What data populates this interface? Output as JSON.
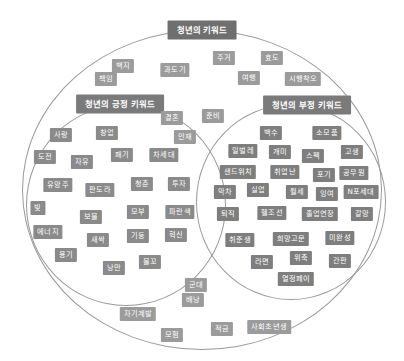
{
  "diagram": {
    "type": "venn-keyword-map",
    "title": "청년의 키워드",
    "groups": {
      "neutral": {
        "label": "청년의 키워드",
        "region": "outer-ellipse"
      },
      "positive": {
        "label": "청년의 긍정 키워드",
        "region": "left-circle"
      },
      "negative": {
        "label": "청년의 부정 키워드",
        "region": "right-circle"
      }
    },
    "colors": {
      "tag_fill": "#9b9b9b",
      "tag_text": "#ffffff",
      "heading_fill": "#7a7a7a",
      "outline": "#9a9a9a",
      "background": "#ffffff"
    },
    "neutral_keywords": [
      {
        "text": "백지",
        "x": 123,
        "y": 66
      },
      {
        "text": "주거",
        "x": 224,
        "y": 58
      },
      {
        "text": "효도",
        "x": 272,
        "y": 58
      },
      {
        "text": "책임",
        "x": 106,
        "y": 79
      },
      {
        "text": "과도기",
        "x": 175,
        "y": 70
      },
      {
        "text": "여행",
        "x": 249,
        "y": 78
      },
      {
        "text": "시행착오",
        "x": 303,
        "y": 79
      },
      {
        "text": "결혼",
        "x": 172,
        "y": 118
      },
      {
        "text": "준비",
        "x": 213,
        "y": 116
      },
      {
        "text": "인재",
        "x": 185,
        "y": 137
      },
      {
        "text": "군대",
        "x": 196,
        "y": 285
      },
      {
        "text": "배낭",
        "x": 193,
        "y": 300
      },
      {
        "text": "자기계발",
        "x": 138,
        "y": 314
      },
      {
        "text": "모험",
        "x": 172,
        "y": 335
      },
      {
        "text": "적금",
        "x": 222,
        "y": 329
      },
      {
        "text": "사회초년생",
        "x": 269,
        "y": 327
      }
    ],
    "positive_keywords": [
      {
        "text": "사랑",
        "x": 61,
        "y": 135
      },
      {
        "text": "창업",
        "x": 107,
        "y": 133
      },
      {
        "text": "도전",
        "x": 45,
        "y": 157
      },
      {
        "text": "자유",
        "x": 82,
        "y": 162
      },
      {
        "text": "패기",
        "x": 122,
        "y": 155
      },
      {
        "text": "차세대",
        "x": 164,
        "y": 155
      },
      {
        "text": "유망주",
        "x": 58,
        "y": 185
      },
      {
        "text": "판도라",
        "x": 100,
        "y": 190
      },
      {
        "text": "청춘",
        "x": 142,
        "y": 184
      },
      {
        "text": "투자",
        "x": 179,
        "y": 184
      },
      {
        "text": "빛",
        "x": 38,
        "y": 208
      },
      {
        "text": "보물",
        "x": 91,
        "y": 217
      },
      {
        "text": "모부",
        "x": 138,
        "y": 212
      },
      {
        "text": "파란색",
        "x": 180,
        "y": 212
      },
      {
        "text": "에너지",
        "x": 48,
        "y": 232
      },
      {
        "text": "새싹",
        "x": 98,
        "y": 240
      },
      {
        "text": "기둥",
        "x": 138,
        "y": 236
      },
      {
        "text": "혁신",
        "x": 176,
        "y": 235
      },
      {
        "text": "용기",
        "x": 66,
        "y": 255
      },
      {
        "text": "낭만",
        "x": 114,
        "y": 268
      },
      {
        "text": "물꼬",
        "x": 150,
        "y": 262
      }
    ],
    "negative_keywords": [
      {
        "text": "백수",
        "x": 271,
        "y": 133
      },
      {
        "text": "소모품",
        "x": 327,
        "y": 133
      },
      {
        "text": "일벌레",
        "x": 243,
        "y": 151
      },
      {
        "text": "개미",
        "x": 280,
        "y": 152
      },
      {
        "text": "스펙",
        "x": 313,
        "y": 156
      },
      {
        "text": "고생",
        "x": 352,
        "y": 152
      },
      {
        "text": "샌드위치",
        "x": 238,
        "y": 172
      },
      {
        "text": "취업난",
        "x": 285,
        "y": 172
      },
      {
        "text": "포기",
        "x": 324,
        "y": 175
      },
      {
        "text": "공무원",
        "x": 354,
        "y": 173
      },
      {
        "text": "막차",
        "x": 225,
        "y": 192
      },
      {
        "text": "실업",
        "x": 258,
        "y": 190
      },
      {
        "text": "월세",
        "x": 297,
        "y": 192
      },
      {
        "text": "잉여",
        "x": 327,
        "y": 194
      },
      {
        "text": "N포세대",
        "x": 361,
        "y": 192
      },
      {
        "text": "퇴직",
        "x": 228,
        "y": 214
      },
      {
        "text": "헬조선",
        "x": 272,
        "y": 213
      },
      {
        "text": "졸업연장",
        "x": 320,
        "y": 214
      },
      {
        "text": "갈망",
        "x": 362,
        "y": 214
      },
      {
        "text": "취준생",
        "x": 240,
        "y": 240
      },
      {
        "text": "희망고문",
        "x": 291,
        "y": 239
      },
      {
        "text": "미완성",
        "x": 340,
        "y": 238
      },
      {
        "text": "라면",
        "x": 262,
        "y": 262
      },
      {
        "text": "위축",
        "x": 301,
        "y": 258
      },
      {
        "text": "간판",
        "x": 340,
        "y": 261
      },
      {
        "text": "열정페이",
        "x": 296,
        "y": 279
      }
    ]
  }
}
